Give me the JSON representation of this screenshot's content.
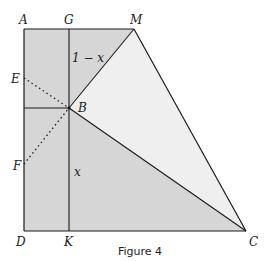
{
  "figure": {
    "caption": "Figure 4",
    "colors": {
      "background": "#ffffff",
      "shade_dark": "#d6d6d6",
      "shade_light": "#efefef",
      "stroke": "#1a1a1a",
      "label": "#222222"
    },
    "points": {
      "A": {
        "label": "A",
        "x": 24,
        "y": 29
      },
      "G": {
        "label": "G",
        "x": 69,
        "y": 29
      },
      "M": {
        "label": "M",
        "x": 134,
        "y": 29
      },
      "E": {
        "label": "E",
        "x": 24,
        "y": 78
      },
      "B": {
        "label": "B",
        "x": 69,
        "y": 108
      },
      "F": {
        "label": "F",
        "x": 24,
        "y": 164
      },
      "D": {
        "label": "D",
        "x": 24,
        "y": 231
      },
      "K": {
        "label": "K",
        "x": 69,
        "y": 231
      },
      "C": {
        "label": "C",
        "x": 246,
        "y": 231
      }
    },
    "segment_labels": {
      "GB": "1 − x",
      "BK": "x"
    }
  }
}
